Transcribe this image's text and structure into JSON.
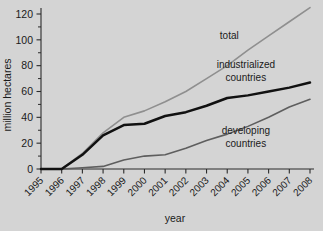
{
  "chart_data": {
    "type": "line",
    "title": "",
    "xlabel": "year",
    "ylabel": "million hectares",
    "x": [
      1995,
      1996,
      1997,
      1998,
      1999,
      2000,
      2001,
      2002,
      2003,
      2004,
      2005,
      2006,
      2007,
      2008
    ],
    "categories": [
      "1995",
      "1996",
      "1997",
      "1998",
      "1999",
      "2000",
      "2001",
      "2002",
      "2003",
      "2004",
      "2005",
      "2006",
      "2007",
      "2008"
    ],
    "xlim": [
      1995,
      2008
    ],
    "ylim": [
      0,
      130
    ],
    "yticks": [
      0,
      20,
      40,
      60,
      80,
      100,
      120
    ],
    "yticklabels": [
      "0",
      "20",
      "40",
      "60",
      "80",
      "100",
      "120"
    ],
    "minor_yticks": [
      10,
      30,
      50,
      70,
      90,
      110
    ],
    "grid": false,
    "legend": "inline-annotations",
    "series": [
      {
        "name": "total",
        "color": "#8f8f8f",
        "values": [
          0,
          0,
          12,
          28,
          40,
          45,
          52,
          60,
          70,
          80,
          92,
          103,
          114,
          125
        ],
        "label_x": 2004.1,
        "label_y": 101
      },
      {
        "name": "industrialized countries",
        "color": "#111111",
        "values": [
          0,
          0,
          11,
          26,
          34,
          35,
          41,
          44,
          49,
          55,
          57,
          60,
          63,
          67
        ],
        "label_x": 2004.9,
        "label_y": 78
      },
      {
        "name": "developing countries",
        "color": "#5e5e5e",
        "values": [
          0,
          0,
          1,
          2,
          7,
          10,
          11,
          16,
          22,
          27,
          33,
          40,
          48,
          54
        ],
        "label_x": 2004.9,
        "label_y": 27
      }
    ],
    "annotations": [
      {
        "text": "total"
      },
      {
        "text": "industrialized"
      },
      {
        "text": "countries"
      },
      {
        "text": "developing"
      },
      {
        "text": "countries"
      }
    ]
  },
  "labels": {
    "y_axis_title": "million hectares",
    "x_axis_title": "year",
    "series_total": "total",
    "series_industrialized_line1": "industrialized",
    "series_industrialized_line2": "countries",
    "series_developing_line1": "developing",
    "series_developing_line2": "countries"
  },
  "colors": {
    "background": "#d4d4d4",
    "axis": "#2b2b2b",
    "total": "#8f8f8f",
    "industrialized": "#111111",
    "developing": "#5e5e5e",
    "text": "#1a1a1a"
  }
}
